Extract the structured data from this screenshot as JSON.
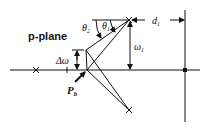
{
  "diagram": {
    "plane_label": "p-plane",
    "labels": {
      "theta2": "θ",
      "theta2_sub": "2",
      "theta1": "θ",
      "theta1_sub": "1",
      "d1": "d",
      "d1_sub": "1",
      "omega1": "ω",
      "omega1_sub": "1",
      "delta_omega": "Δω",
      "pb": "P",
      "pb_sub": "b"
    },
    "colors": {
      "ink": "#111111",
      "background": "#ffffff"
    }
  }
}
